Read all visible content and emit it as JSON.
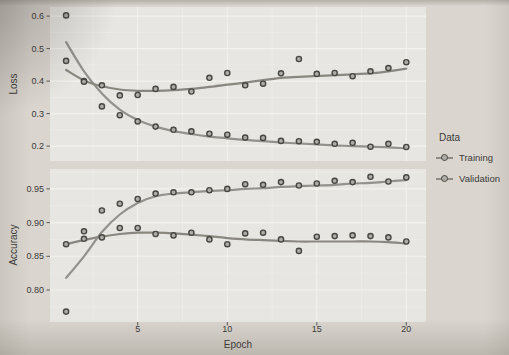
{
  "chart_data": {
    "type": "scatter",
    "style": "scatter points with loess smooth lines, two stacked facets sharing x axis, greyscale print",
    "x_label": "Epoch",
    "x": [
      1,
      2,
      3,
      4,
      5,
      6,
      7,
      8,
      9,
      10,
      11,
      12,
      13,
      14,
      15,
      16,
      17,
      18,
      19,
      20
    ],
    "x_ticks": [
      5,
      10,
      15,
      20
    ],
    "x_tick_labels": [
      "5",
      "10",
      "15",
      "20"
    ],
    "x_minor": [
      2.5,
      7.5,
      12.5,
      17.5
    ],
    "xlim": [
      0.1,
      21.1
    ],
    "grid": "white major and minor gridlines on light grey panel",
    "legend": {
      "title": "Data",
      "position": "right",
      "items": [
        {
          "label": "Training"
        },
        {
          "label": "Validation"
        }
      ]
    },
    "facets": [
      {
        "ylabel": "Loss",
        "ylim": [
          0.154,
          0.628
        ],
        "y_ticks": [
          0.6,
          0.5,
          0.4,
          0.3,
          0.2
        ],
        "y_tick_labels": [
          "0.6",
          "0.5",
          "0.4",
          "0.3",
          "0.2"
        ],
        "y_minor": [
          0.55,
          0.45,
          0.35,
          0.25
        ],
        "series": [
          {
            "name": "Training",
            "points": [
              0.602,
              0.4,
              0.322,
              0.295,
              0.276,
              0.26,
              0.25,
              0.245,
              0.238,
              0.235,
              0.226,
              0.225,
              0.216,
              0.215,
              0.213,
              0.207,
              0.21,
              0.198,
              0.207,
              0.197
            ],
            "smooth": [
              0.52,
              0.43,
              0.362,
              0.312,
              0.28,
              0.26,
              0.246,
              0.237,
              0.229,
              0.224,
              0.219,
              0.215,
              0.211,
              0.208,
              0.205,
              0.202,
              0.2,
              0.198,
              0.196,
              0.193
            ]
          },
          {
            "name": "Validation",
            "points": [
              0.462,
              0.398,
              0.387,
              0.356,
              0.357,
              0.376,
              0.382,
              0.368,
              0.41,
              0.425,
              0.387,
              0.392,
              0.424,
              0.468,
              0.422,
              0.425,
              0.415,
              0.43,
              0.44,
              0.458
            ],
            "smooth": [
              0.434,
              0.402,
              0.384,
              0.374,
              0.37,
              0.37,
              0.372,
              0.376,
              0.382,
              0.389,
              0.395,
              0.403,
              0.41,
              0.413,
              0.416,
              0.418,
              0.421,
              0.424,
              0.43,
              0.438
            ]
          }
        ]
      },
      {
        "ylabel": "Accuracy",
        "ylim": [
          0.7525,
          0.9795
        ],
        "y_ticks": [
          0.95,
          0.9,
          0.85,
          0.8
        ],
        "y_tick_labels": [
          "0.95",
          "0.90",
          "0.85",
          "0.80"
        ],
        "y_minor": [
          0.975,
          0.925,
          0.875,
          0.825,
          0.775
        ],
        "series": [
          {
            "name": "Training",
            "points": [
              0.768,
              0.887,
              0.918,
              0.928,
              0.935,
              0.943,
              0.945,
              0.945,
              0.948,
              0.95,
              0.957,
              0.956,
              0.96,
              0.955,
              0.958,
              0.962,
              0.96,
              0.968,
              0.961,
              0.967
            ],
            "smooth": [
              0.818,
              0.85,
              0.886,
              0.912,
              0.929,
              0.939,
              0.943,
              0.945,
              0.947,
              0.948,
              0.95,
              0.951,
              0.953,
              0.954,
              0.955,
              0.956,
              0.958,
              0.959,
              0.961,
              0.963
            ]
          },
          {
            "name": "Validation",
            "points": [
              0.868,
              0.876,
              0.878,
              0.892,
              0.892,
              0.883,
              0.881,
              0.885,
              0.875,
              0.868,
              0.884,
              0.885,
              0.875,
              0.858,
              0.879,
              0.88,
              0.881,
              0.88,
              0.878,
              0.872
            ],
            "smooth": [
              0.868,
              0.874,
              0.879,
              0.883,
              0.885,
              0.885,
              0.884,
              0.882,
              0.88,
              0.877,
              0.875,
              0.874,
              0.873,
              0.872,
              0.872,
              0.872,
              0.872,
              0.872,
              0.871,
              0.869
            ]
          }
        ]
      }
    ],
    "colors": {
      "page_bg": "#dad6cf",
      "panel_bg": "#e8e6e2",
      "grid_major": "#f5f4f1",
      "grid_minor": "#f0efeb",
      "line_training": "#93918c",
      "line_validation": "#89877f",
      "point_stroke": "#474641",
      "point_fill": "#aeaca6",
      "tick_mark": "#4a4948",
      "text": "#3a3938"
    }
  }
}
